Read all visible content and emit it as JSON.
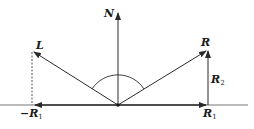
{
  "diagram": {
    "colors": {
      "stroke": "#2a2a2a",
      "background": "#ffffff"
    },
    "origin": {
      "x": 118,
      "y": 105
    },
    "vectors": [
      {
        "id": "N",
        "label": "N",
        "subscript": "",
        "from": [
          118,
          105
        ],
        "to": [
          118,
          12
        ]
      },
      {
        "id": "L",
        "label": "L",
        "subscript": "",
        "from": [
          118,
          105
        ],
        "to": [
          33,
          52
        ]
      },
      {
        "id": "R",
        "label": "R",
        "subscript": "",
        "from": [
          118,
          105
        ],
        "to": [
          207,
          50
        ]
      },
      {
        "id": "R1",
        "label": "R",
        "subscript": "1",
        "from": [
          118,
          105
        ],
        "to": [
          208,
          105
        ]
      },
      {
        "id": "negR1",
        "label": "−R",
        "subscript": "1",
        "from": [
          118,
          105
        ],
        "to": [
          33,
          105
        ]
      },
      {
        "id": "R2",
        "label": "R",
        "subscript": "2",
        "from": [
          208,
          105
        ],
        "to": [
          208,
          50
        ]
      }
    ],
    "labels": {
      "N": {
        "text": "N",
        "sub": ""
      },
      "L": {
        "text": "L",
        "sub": ""
      },
      "R": {
        "text": "R",
        "sub": ""
      },
      "R1": {
        "text": "R",
        "sub": "1"
      },
      "R2": {
        "text": "R",
        "sub": "2"
      },
      "negR1": {
        "text": "−R",
        "sub": "1"
      }
    },
    "baseline": {
      "from": [
        0,
        105
      ],
      "to": [
        248,
        105
      ]
    },
    "dashed_projection": {
      "from": [
        32,
        52
      ],
      "to": [
        32,
        105
      ]
    },
    "angle_arc": {
      "center": [
        118,
        105
      ],
      "radius": 31,
      "from_deg": 148,
      "to_deg": 32
    }
  }
}
